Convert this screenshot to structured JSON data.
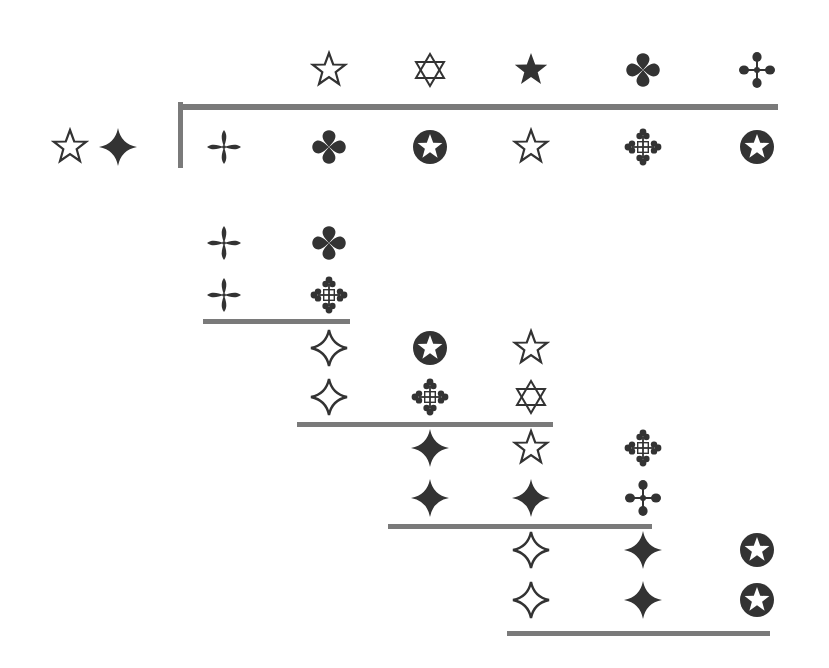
{
  "diagram": {
    "colors": {
      "ink": "#333333",
      "rule": "#7a7a7a",
      "background": "#ffffff"
    },
    "key": [
      {
        "icon": "star-outline",
        "x": 70,
        "y": 147
      },
      {
        "icon": "four-point-star-filled",
        "x": 118,
        "y": 147
      }
    ],
    "rules": [
      {
        "name": "bracket-vertical",
        "x": 178,
        "y": 102,
        "w": 5,
        "h": 66
      },
      {
        "name": "bracket-top",
        "x": 178,
        "y": 104,
        "w": 600,
        "h": 6
      },
      {
        "name": "block-1-underline",
        "x": 203,
        "y": 319,
        "w": 147,
        "h": 5
      },
      {
        "name": "block-2-underline",
        "x": 297,
        "y": 422,
        "w": 256,
        "h": 5
      },
      {
        "name": "block-3-underline",
        "x": 388,
        "y": 524,
        "w": 264,
        "h": 5
      },
      {
        "name": "block-4-underline",
        "x": 507,
        "y": 631,
        "w": 263,
        "h": 5
      }
    ],
    "top_section": {
      "row_above": [
        {
          "icon": "star-outline",
          "x": 329,
          "y": 70
        },
        {
          "icon": "star-of-david",
          "x": 430,
          "y": 70
        },
        {
          "icon": "star-filled",
          "x": 531,
          "y": 70
        },
        {
          "icon": "quatrefoil",
          "x": 643,
          "y": 70
        },
        {
          "icon": "ball-cross",
          "x": 757,
          "y": 70
        }
      ],
      "row_below": [
        {
          "icon": "propeller",
          "x": 224,
          "y": 147
        },
        {
          "icon": "quatrefoil",
          "x": 329,
          "y": 147
        },
        {
          "icon": "circled-star",
          "x": 430,
          "y": 147
        },
        {
          "icon": "star-outline",
          "x": 531,
          "y": 147
        },
        {
          "icon": "trefoil-cross",
          "x": 643,
          "y": 147
        },
        {
          "icon": "circled-star",
          "x": 757,
          "y": 147
        }
      ]
    },
    "staircase": [
      {
        "name": "block-1",
        "cells": [
          {
            "icon": "propeller",
            "x": 224,
            "y": 243
          },
          {
            "icon": "quatrefoil",
            "x": 329,
            "y": 243
          },
          {
            "icon": "propeller",
            "x": 224,
            "y": 295
          },
          {
            "icon": "trefoil-cross",
            "x": 329,
            "y": 295
          }
        ]
      },
      {
        "name": "block-2",
        "cells": [
          {
            "icon": "four-point-star-outline",
            "x": 329,
            "y": 348
          },
          {
            "icon": "circled-star",
            "x": 430,
            "y": 348
          },
          {
            "icon": "star-outline",
            "x": 531,
            "y": 348
          },
          {
            "icon": "four-point-star-outline",
            "x": 329,
            "y": 397
          },
          {
            "icon": "trefoil-cross",
            "x": 430,
            "y": 397
          },
          {
            "icon": "star-of-david",
            "x": 531,
            "y": 397
          }
        ]
      },
      {
        "name": "block-3",
        "cells": [
          {
            "icon": "four-point-star-filled",
            "x": 430,
            "y": 448
          },
          {
            "icon": "star-outline",
            "x": 531,
            "y": 448
          },
          {
            "icon": "trefoil-cross",
            "x": 643,
            "y": 448
          },
          {
            "icon": "four-point-star-filled",
            "x": 430,
            "y": 498
          },
          {
            "icon": "four-point-star-filled",
            "x": 531,
            "y": 498
          },
          {
            "icon": "ball-cross",
            "x": 643,
            "y": 498
          }
        ]
      },
      {
        "name": "block-4",
        "cells": [
          {
            "icon": "four-point-star-outline",
            "x": 531,
            "y": 550
          },
          {
            "icon": "four-point-star-filled",
            "x": 643,
            "y": 550
          },
          {
            "icon": "circled-star",
            "x": 757,
            "y": 550
          },
          {
            "icon": "four-point-star-outline",
            "x": 531,
            "y": 600
          },
          {
            "icon": "four-point-star-filled",
            "x": 643,
            "y": 600
          },
          {
            "icon": "circled-star",
            "x": 757,
            "y": 600
          }
        ]
      }
    ]
  }
}
